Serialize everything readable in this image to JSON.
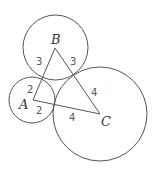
{
  "diagram": {
    "type": "three mutually tangent circles with triangle connecting centers",
    "stroke_color": "#555555",
    "circles": [
      {
        "name": "A",
        "cx": 33,
        "cy": 100,
        "r": 23
      },
      {
        "name": "B",
        "cx": 55,
        "cy": 48,
        "r": 33
      },
      {
        "name": "C",
        "cx": 100,
        "cy": 114,
        "r": 47
      }
    ],
    "vertices": {
      "A": {
        "label": "A",
        "x": 33,
        "y": 100
      },
      "B": {
        "label": "B",
        "x": 55,
        "y": 48
      },
      "C": {
        "label": "C",
        "x": 100,
        "y": 114
      }
    },
    "segment_labels": {
      "AB_near_B": "3",
      "BC_near_B": "3",
      "AB_near_A": "2",
      "AC_near_A": "2",
      "BC_near_C": "4",
      "AC_near_C": "4"
    }
  }
}
